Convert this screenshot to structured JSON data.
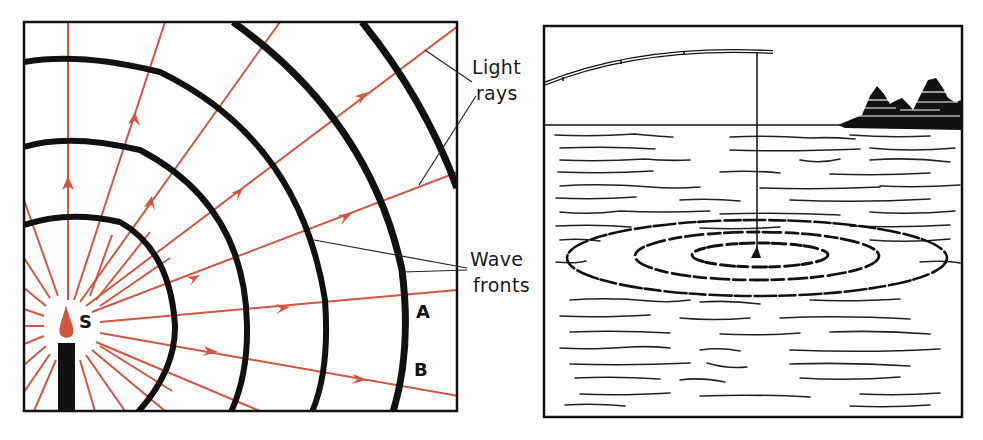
{
  "left_panel": {
    "name": "wave-fronts-diagram",
    "source_label": "S",
    "labels": {
      "light_rays_line1": "Light",
      "light_rays_line2": "rays",
      "wave_fronts_line1": "Wave",
      "wave_fronts_line2": "fronts",
      "point_a": "A",
      "point_b": "B"
    },
    "colors": {
      "ray": "#d2553f",
      "wavefront": "#111111",
      "flame": "#d2553f",
      "candle": "#111111"
    },
    "wavefront_count": 4,
    "ray_count": 12
  },
  "right_panel": {
    "name": "fishing-ripples-illustration",
    "elements": [
      "fishing-rod",
      "fishing-line",
      "bobber",
      "ripple-rings",
      "tree-line",
      "water-surface"
    ],
    "ripple_ring_count": 3
  }
}
